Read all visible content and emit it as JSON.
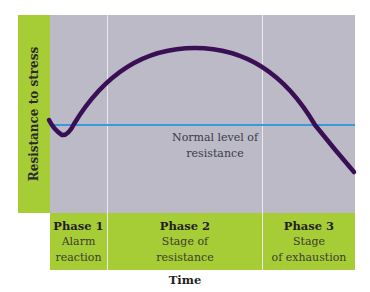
{
  "diagram": {
    "y_axis_label": "Resistance to stress",
    "x_axis_label": "Time",
    "baseline_label_line1": "Normal level of",
    "baseline_label_line2": "resistance",
    "phases": [
      {
        "title": "Phase 1",
        "line1": "Alarm",
        "line2": "reaction"
      },
      {
        "title": "Phase 2",
        "line1": "Stage of",
        "line2": "resistance"
      },
      {
        "title": "Phase 3",
        "line1": "Stage",
        "line2": "of exhaustion"
      }
    ],
    "colors": {
      "green": "#a6cc36",
      "plot_bg": "#bbbac6",
      "curve": "#3b0f55",
      "baseline": "#3a9ad9"
    }
  }
}
